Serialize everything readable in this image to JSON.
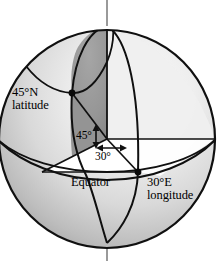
{
  "figure": {
    "kind": "geometry-diagram",
    "canvas": {
      "width": 224,
      "height": 261
    },
    "sphere": {
      "center_x": 107,
      "center_y": 139,
      "radius_x": 108,
      "radius_y": 109,
      "outline_color": "#101010",
      "highlight_color": "#f2f2f2",
      "shadow_color": "#8d8d8d",
      "sector_fill": "#8f8f8f",
      "triangle_fill": "#ffffff",
      "axis_color": "#9a9a9a"
    },
    "labels": {
      "latitude": "45°N\nlatitude",
      "latitude_line1": "45°N",
      "latitude_line2": "latitude",
      "equator": "Equator",
      "longitude_line1": "30°E",
      "longitude_line2": "longitude",
      "angle_latitude": "45°",
      "angle_longitude": "30°"
    },
    "points": [
      {
        "name": "north-pole",
        "x": 107,
        "y": 25
      },
      {
        "name": "south-pole",
        "x": 107,
        "y": 243
      },
      {
        "name": "surface-point-45n-30e",
        "x": 72,
        "y": 93
      },
      {
        "name": "center",
        "x": 107,
        "y": 139
      },
      {
        "name": "equator-point-30e",
        "x": 138,
        "y": 172
      },
      {
        "name": "projection-point",
        "x": 96,
        "y": 127
      }
    ],
    "values": {
      "latitude_degrees": 45,
      "latitude_hemisphere": "N",
      "longitude_degrees": 30,
      "longitude_hemisphere": "E"
    }
  }
}
